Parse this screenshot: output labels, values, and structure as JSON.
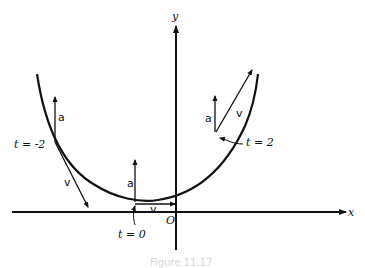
{
  "diagram": {
    "axes": {
      "x_label": "x",
      "y_label": "y",
      "origin_label": "O"
    },
    "curve": "parabola",
    "points": [
      {
        "label": "t = -2",
        "vectors": [
          "a",
          "v"
        ]
      },
      {
        "label": "t = 0",
        "vectors": [
          "a",
          "v"
        ]
      },
      {
        "label": "t = 2",
        "vectors": [
          "a",
          "v"
        ]
      }
    ],
    "vector_labels": {
      "acceleration": "a",
      "velocity": "v"
    },
    "caption": "Figure 11.17"
  },
  "colors": {
    "ink": "#111111",
    "background": "#ffffff"
  }
}
